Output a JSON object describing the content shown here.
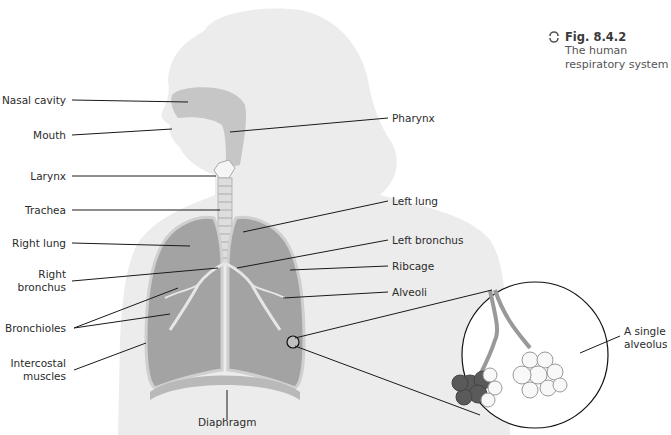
{
  "figure": {
    "number": "Fig. 8.4.2",
    "caption_line1": "The human",
    "caption_line2": "respiratory system",
    "icon": "cycle-arrows-icon"
  },
  "labels_left": {
    "nasal_cavity": "Nasal cavity",
    "mouth": "Mouth",
    "larynx": "Larynx",
    "trachea": "Trachea",
    "right_lung": "Right lung",
    "right_bronchus_1": "Right",
    "right_bronchus_2": "bronchus",
    "bronchioles": "Bronchioles",
    "intercostal_1": "Intercostal",
    "intercostal_2": "muscles"
  },
  "labels_right": {
    "pharynx": "Pharynx",
    "left_lung": "Left lung",
    "left_bronchus": "Left bronchus",
    "ribcage": "Ribcage",
    "alveoli": "Alveoli"
  },
  "labels_bottom": {
    "diaphragm": "Diaphragm"
  },
  "inset": {
    "alveolus_1": "A single",
    "alveolus_2": "alveolus"
  },
  "colors": {
    "silhouette": "#e8e8e8",
    "airway": "#bdbdbd",
    "lung": "#9e9e9e",
    "leader_line": "#1a1a1a",
    "alveolus_dark": "#5a5a5a"
  }
}
